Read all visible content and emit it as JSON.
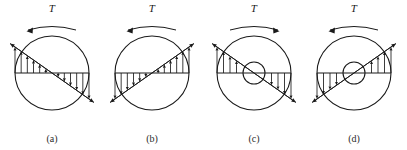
{
  "figure": {
    "type": "engineering-diagram",
    "panel_count": 4,
    "background_color": "#ffffff",
    "line_color": "#1a1a1a",
    "panels": [
      {
        "id": "a",
        "caption": "(a)",
        "torque_symbol": "T",
        "torque_direction": "counterclockwise",
        "torque_arrow_points": "left",
        "shaft_type": "solid",
        "has_inner_hole": false,
        "diagonal_orientation": "descending",
        "left_arrow_direction": "up",
        "right_arrow_direction": "down",
        "left_arrow_count": 6,
        "right_arrow_count": 6,
        "center_x": 50,
        "center_y": 73,
        "outer_radius": 37,
        "inner_radius": 0
      },
      {
        "id": "b",
        "caption": "(b)",
        "torque_symbol": "T",
        "torque_direction": "counterclockwise",
        "torque_arrow_points": "left",
        "shaft_type": "solid",
        "has_inner_hole": false,
        "diagonal_orientation": "ascending",
        "left_arrow_direction": "down",
        "right_arrow_direction": "up",
        "left_arrow_count": 6,
        "right_arrow_count": 6,
        "center_x": 50,
        "center_y": 73,
        "outer_radius": 37,
        "inner_radius": 0
      },
      {
        "id": "c",
        "caption": "(c)",
        "torque_symbol": "T",
        "torque_direction": "clockwise",
        "torque_arrow_points": "right",
        "shaft_type": "hollow",
        "has_inner_hole": true,
        "diagonal_orientation": "descending",
        "left_arrow_direction": "up",
        "right_arrow_direction": "down",
        "left_arrow_count": 4,
        "right_arrow_count": 4,
        "center_x": 50,
        "center_y": 73,
        "outer_radius": 37,
        "inner_radius": 11
      },
      {
        "id": "d",
        "caption": "(d)",
        "torque_symbol": "T",
        "torque_direction": "counterclockwise",
        "torque_arrow_points": "left",
        "shaft_type": "hollow",
        "has_inner_hole": true,
        "diagonal_orientation": "ascending",
        "left_arrow_direction": "down",
        "right_arrow_direction": "up",
        "left_arrow_count": 4,
        "right_arrow_count": 4,
        "center_x": 50,
        "center_y": 73,
        "outer_radius": 37,
        "inner_radius": 11
      }
    ],
    "panel_positions": [
      2,
      102,
      204,
      304
    ]
  }
}
